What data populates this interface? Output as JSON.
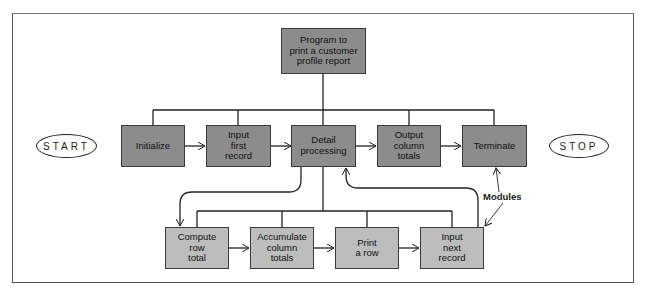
{
  "diagram": {
    "type": "structure chart",
    "root": {
      "label": "Program to\nprint a customer\nprofile report"
    },
    "terminals": {
      "start": "START",
      "stop": "STOP"
    },
    "level1": [
      {
        "label": "Initialize"
      },
      {
        "label": "Input\nfirst\nrecord"
      },
      {
        "label": "Detail\nprocessing"
      },
      {
        "label": "Output\ncolumn\ntotals"
      },
      {
        "label": "Terminate"
      }
    ],
    "level2": [
      {
        "label": "Compute\nrow\ntotal"
      },
      {
        "label": "Accumulate\ncolumn\ntotals"
      },
      {
        "label": "Print\na row"
      },
      {
        "label": "Input\nnext\nrecord"
      }
    ],
    "annotation": "Modules",
    "colors": {
      "level1_fill": "#8c8c8c",
      "level2_fill": "#bdbdbd",
      "line": "#222222"
    }
  }
}
